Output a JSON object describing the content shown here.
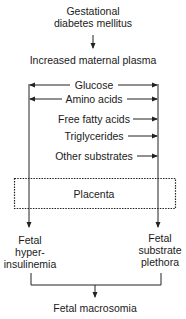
{
  "diagram": {
    "title_node": {
      "line1": "Gestational",
      "line2": "diabetes mellitus"
    },
    "maternal_node": "Increased maternal plasma",
    "substrates": [
      {
        "label": "Glucose",
        "left_arrow": true,
        "right_arrow": true
      },
      {
        "label": "Amino acids",
        "left_arrow": true,
        "right_arrow": true
      },
      {
        "label": "Free fatty acids",
        "left_arrow": false,
        "right_arrow": true
      },
      {
        "label": "Triglycerides",
        "left_arrow": false,
        "right_arrow": true
      },
      {
        "label": "Other substrates",
        "left_arrow": false,
        "right_arrow": true
      }
    ],
    "barrier": "Placenta",
    "left_outcome": {
      "line1": "Fetal",
      "line2": "hyper-",
      "line3": "insulinemia"
    },
    "right_outcome": {
      "line1": "Fetal",
      "line2": "substrate",
      "line3": "plethora"
    },
    "final_node": "Fetal macrosomia",
    "colors": {
      "line": "#222222",
      "text": "#1a1a1a",
      "background": "#ffffff"
    }
  }
}
